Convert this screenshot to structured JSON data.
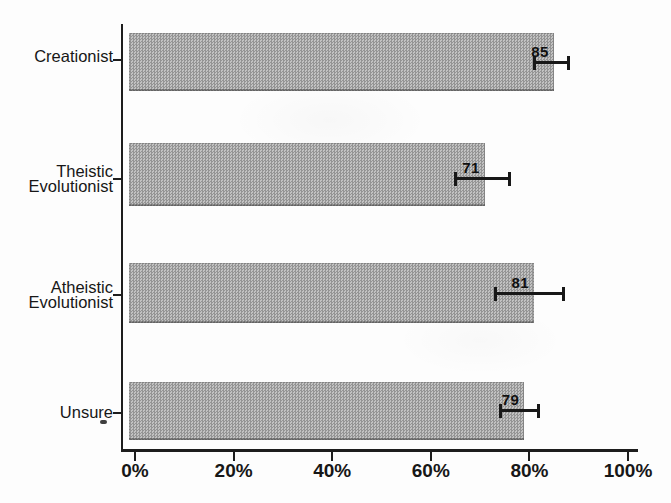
{
  "chart_data": {
    "type": "bar",
    "orientation": "horizontal",
    "title": "",
    "xlabel": "",
    "ylabel": "",
    "grid": false,
    "legend": false,
    "categories": [
      "Creationist",
      "Theistic Evolutionist",
      "Atheistic Evolutionist",
      "Unsure"
    ],
    "category_lines": [
      [
        "Creationist"
      ],
      [
        "Theistic",
        "Evolutionist"
      ],
      [
        "Atheistic",
        "Evolutionist"
      ],
      [
        "Unsure"
      ]
    ],
    "values": [
      85,
      71,
      81,
      79
    ],
    "bar_labels": [
      "85",
      "71",
      "81",
      "79"
    ],
    "error_bars": [
      [
        81,
        88
      ],
      [
        65,
        76
      ],
      [
        73,
        87
      ],
      [
        74,
        82
      ]
    ],
    "x_ticks": [
      "0%",
      "20%",
      "40%",
      "60%",
      "80%",
      "100%"
    ],
    "x_tick_values": [
      0,
      20,
      40,
      60,
      80,
      100
    ],
    "xlim": [
      0,
      100
    ],
    "bar_color": "#acacac",
    "axis_color": "#1d1d1d",
    "text_color": "#171717"
  }
}
